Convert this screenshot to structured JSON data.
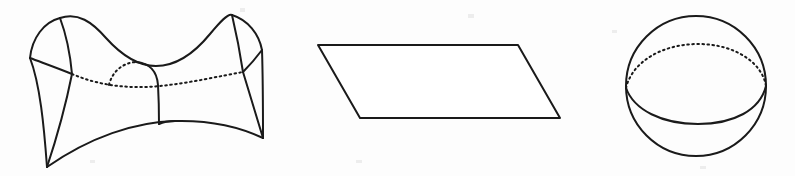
{
  "figure": {
    "background_color": "#fdfdfd",
    "ink_color": "#1a1a1a",
    "width": 795,
    "height": 176,
    "panel_count": 3
  },
  "panels": [
    {
      "id": "hyperbolic",
      "name": "saddle-surface",
      "label": "Hyperbolic (negative curvature) saddle surface",
      "curvature_sign": "negative",
      "shape_type": "saddle",
      "has_hidden_lines": true,
      "center_x": 155,
      "center_y": 90
    },
    {
      "id": "euclidean",
      "name": "plane-parallelogram",
      "label": "Euclidean (zero curvature) plane",
      "curvature_sign": "zero",
      "shape_type": "parallelogram",
      "has_hidden_lines": false,
      "center_x": 439,
      "center_y": 81
    },
    {
      "id": "spherical",
      "name": "sphere",
      "label": "Spherical (positive curvature) sphere",
      "curvature_sign": "positive",
      "shape_type": "sphere",
      "has_hidden_lines": true,
      "center_x": 696,
      "center_y": 86
    }
  ],
  "geometry": {
    "saddle": {
      "top_rim": "M 60,18 C 78,12 92,22 106,38 C 124,58 140,66 156,66 C 174,66 192,56 210,34 C 220,22 228,13 232,15",
      "left_flap_outer": "M 60,18 C 44,22 32,38 30,58",
      "left_flap_inner": "M 60,18 C 66,34 70,52 72,74",
      "left_flap_base": "M 30,58 C 46,64 60,69 72,74",
      "right_flap_outer": "M 232,15 C 248,20 259,34 262,50",
      "right_flap_inner": "M 232,15 C 236,32 240,52 243,72",
      "right_flap_base": "M 262,50 C 256,58 250,65 243,72",
      "left_edge": "M 72,74 C 66,104 56,140 47,167",
      "right_edge": "M 243,72 C 250,95 257,118 263,138",
      "bottom_front": "M 47,167 C 90,137 135,122 175,121 C 212,120 242,128 263,138",
      "left_lower_panel": "M 30,58 C 40,84 44,126 47,167",
      "right_lower_panel": "M 262,50 C 263,80 263,112 263,138",
      "neck_dotted_arc": "M 72,74 C 100,86 130,89 160,86 C 190,83 220,76 243,72",
      "neck_back_dotted": "M 109,85 C 112,72 122,63 136,62",
      "neck_front_solid": "M 136,62 C 150,63 157,72 158,85 C 159,103 159,116 159,124",
      "neck_bottom_join": "M 159,124 C 163,122 170,121 175,121"
    },
    "plane": {
      "outline": "M 318,45 L 518,45 L 560,118 L 360,118 Z"
    },
    "sphere": {
      "circle_cx": 696,
      "circle_cy": 86,
      "circle_r": 70,
      "equator_back": "M 626,88 C 632,62 662,44 698,44 C 734,44 762,62 766,86",
      "equator_front": "M 626,88 C 634,110 662,124 698,124 C 734,124 760,110 766,86"
    }
  },
  "specks": [
    {
      "x": 240,
      "y": 8,
      "w": 5,
      "h": 4
    },
    {
      "x": 468,
      "y": 14,
      "w": 6,
      "h": 4
    },
    {
      "x": 612,
      "y": 30,
      "w": 5,
      "h": 3
    },
    {
      "x": 356,
      "y": 160,
      "w": 6,
      "h": 3
    },
    {
      "x": 90,
      "y": 160,
      "w": 5,
      "h": 3
    },
    {
      "x": 700,
      "y": 166,
      "w": 6,
      "h": 3
    }
  ]
}
